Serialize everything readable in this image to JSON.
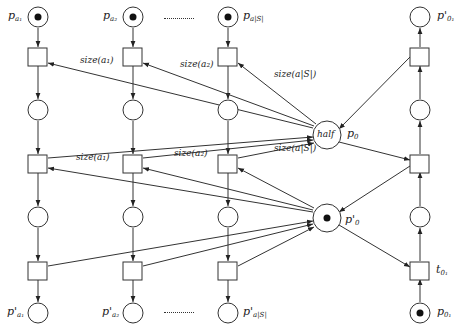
{
  "diagram": {
    "type": "petri-net",
    "columns": [
      {
        "id": "a1",
        "top_place": {
          "label": "p",
          "sub": "a₁",
          "token": true
        },
        "bottom_place": {
          "label": "p'",
          "sub": "a₁",
          "token": false
        },
        "arc_labels": {
          "row1": "size(a₁)",
          "row2": "size(a₁)"
        }
      },
      {
        "id": "a2",
        "top_place": {
          "label": "p",
          "sub": "a₂",
          "token": true
        },
        "bottom_place": {
          "label": "p'",
          "sub": "a₂",
          "token": false
        },
        "arc_labels": {
          "row1": "size(a₂)",
          "row2": "size(a₂)"
        }
      },
      {
        "id": "aS",
        "top_place": {
          "label": "p",
          "sub": "a|S|",
          "token": true
        },
        "bottom_place": {
          "label": "p'",
          "sub": "a|S|",
          "token": false
        },
        "arc_labels": {
          "row1": "size(a|S|)",
          "row2": "size(a|S|)"
        }
      }
    ],
    "ellipsis": "..........",
    "center": {
      "p0": {
        "inner_label": "half",
        "label": "p",
        "sub": "0",
        "token": false
      },
      "p0_prime": {
        "label": "p'",
        "sub": "0",
        "token": true
      }
    },
    "right_column": {
      "top_place": {
        "label": "p'",
        "sub": "0₁",
        "token": false
      },
      "bottom_place": {
        "label": "p",
        "sub": "0₁",
        "token": true
      },
      "transition": {
        "label": "t",
        "sub": "0₁"
      }
    }
  }
}
